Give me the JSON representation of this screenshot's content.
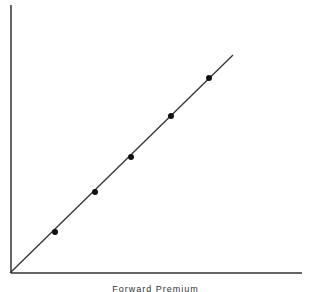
{
  "chart_data": {
    "type": "scatter",
    "title": "",
    "xlabel": "Forward Premium",
    "ylabel": "",
    "grid": false,
    "legend": null,
    "points_px": [
      [
        55,
        232
      ],
      [
        95,
        192
      ],
      [
        131,
        157
      ],
      [
        171,
        116
      ],
      [
        209,
        78
      ]
    ],
    "x": [
      1,
      2,
      3,
      4,
      5
    ],
    "y": [
      1,
      2,
      3,
      4,
      5
    ],
    "fit_line": {
      "from_px": [
        10,
        273
      ],
      "to_px": [
        233,
        55
      ]
    },
    "axes_px": {
      "origin": [
        10,
        273
      ],
      "x_end": [
        302,
        273
      ],
      "y_top": [
        10,
        5
      ]
    }
  },
  "colors": {
    "axis": "#333333",
    "line": "#333333",
    "point": "#111111"
  }
}
